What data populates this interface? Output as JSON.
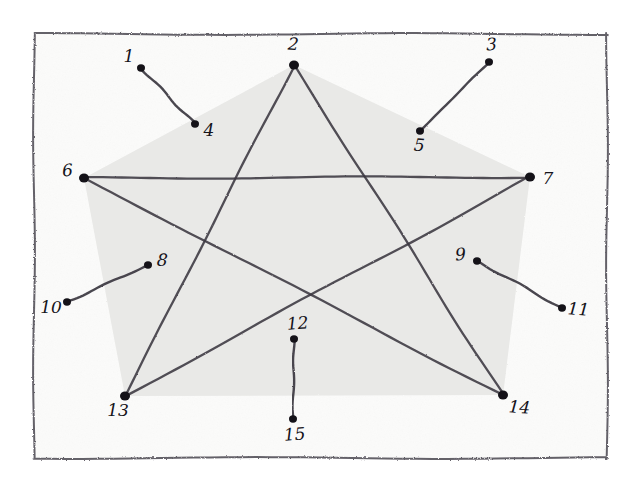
{
  "figure": {
    "medium": "pencil sketch on white paper",
    "frame": {
      "name": "hand-drawn rectangle border",
      "x": 34,
      "y": 34,
      "width": 573,
      "height": 424,
      "stroke_color": "#4a4650"
    },
    "background_color": "#ffffff",
    "paper_color": "#fbfbfa",
    "ink_color": "#3b3741",
    "dot_color": "#141218",
    "shade_outer_color": "#d9d9d7",
    "shade_inner_color": "#e9e9e7"
  },
  "star": {
    "name": "five-pointed star pentagram",
    "vertices": [
      {
        "label": "2",
        "x": 294,
        "y": 65,
        "position": "top"
      },
      {
        "label": "7",
        "x": 530,
        "y": 177,
        "position": "right"
      },
      {
        "label": "14",
        "x": 503,
        "y": 395,
        "position": "bottom-right"
      },
      {
        "label": "13",
        "x": 125,
        "y": 396,
        "position": "bottom-left"
      },
      {
        "label": "6",
        "x": 84,
        "y": 178,
        "position": "left"
      }
    ],
    "edges": [
      {
        "from": "2",
        "to": "14"
      },
      {
        "from": "14",
        "to": "6"
      },
      {
        "from": "6",
        "to": "7"
      },
      {
        "from": "7",
        "to": "13"
      },
      {
        "from": "13",
        "to": "2"
      }
    ]
  },
  "points": [
    {
      "id": 1,
      "label": "1",
      "dot_x": 141,
      "dot_y": 68,
      "label_x": 129,
      "label_y": 62,
      "label_anchor": "middle"
    },
    {
      "id": 2,
      "label": "2",
      "dot_x": 294,
      "dot_y": 65,
      "label_x": 293,
      "label_y": 50,
      "label_anchor": "middle"
    },
    {
      "id": 3,
      "label": "3",
      "dot_x": 489,
      "dot_y": 62,
      "label_x": 492,
      "label_y": 50,
      "label_anchor": "middle"
    },
    {
      "id": 4,
      "label": "4",
      "dot_x": 195,
      "dot_y": 124,
      "label_x": 209,
      "label_y": 136,
      "label_anchor": "middle"
    },
    {
      "id": 5,
      "label": "5",
      "dot_x": 420,
      "dot_y": 131,
      "label_x": 419,
      "label_y": 151,
      "label_anchor": "middle"
    },
    {
      "id": 6,
      "label": "6",
      "dot_x": 84,
      "dot_y": 178,
      "label_x": 68,
      "label_y": 176,
      "label_anchor": "middle"
    },
    {
      "id": 7,
      "label": "7",
      "dot_x": 530,
      "dot_y": 177,
      "label_x": 548,
      "label_y": 184,
      "label_anchor": "middle"
    },
    {
      "id": 8,
      "label": "8",
      "dot_x": 148,
      "dot_y": 265,
      "label_x": 162,
      "label_y": 266,
      "label_anchor": "middle"
    },
    {
      "id": 9,
      "label": "9",
      "dot_x": 477,
      "dot_y": 261,
      "label_x": 461,
      "label_y": 260,
      "label_anchor": "middle"
    },
    {
      "id": 10,
      "label": "10",
      "dot_x": 67,
      "dot_y": 302,
      "label_x": 51,
      "label_y": 313,
      "label_anchor": "middle"
    },
    {
      "id": 11,
      "label": "11",
      "dot_x": 562,
      "dot_y": 308,
      "label_x": 578,
      "label_y": 315,
      "label_anchor": "middle"
    },
    {
      "id": 12,
      "label": "12",
      "dot_x": 294,
      "dot_y": 339,
      "label_x": 298,
      "label_y": 329,
      "label_anchor": "middle"
    },
    {
      "id": 13,
      "label": "13",
      "dot_x": 125,
      "dot_y": 396,
      "label_x": 118,
      "label_y": 416,
      "label_anchor": "middle"
    },
    {
      "id": 14,
      "label": "14",
      "dot_x": 503,
      "dot_y": 395,
      "label_x": 519,
      "label_y": 413,
      "label_anchor": "middle"
    },
    {
      "id": 15,
      "label": "15",
      "dot_x": 293,
      "dot_y": 419,
      "label_x": 295,
      "label_y": 440,
      "label_anchor": "middle"
    }
  ],
  "segments": [
    {
      "name": "segment-1-4",
      "from": 1,
      "to": 4,
      "from_label": "1",
      "to_label": "4"
    },
    {
      "name": "segment-3-5",
      "from": 3,
      "to": 5,
      "from_label": "3",
      "to_label": "5"
    },
    {
      "name": "segment-8-10",
      "from": 8,
      "to": 10,
      "from_label": "8",
      "to_label": "10"
    },
    {
      "name": "segment-9-11",
      "from": 9,
      "to": 11,
      "from_label": "9",
      "to_label": "11"
    },
    {
      "name": "segment-12-15",
      "from": 12,
      "to": 15,
      "from_label": "12",
      "to_label": "15"
    }
  ]
}
